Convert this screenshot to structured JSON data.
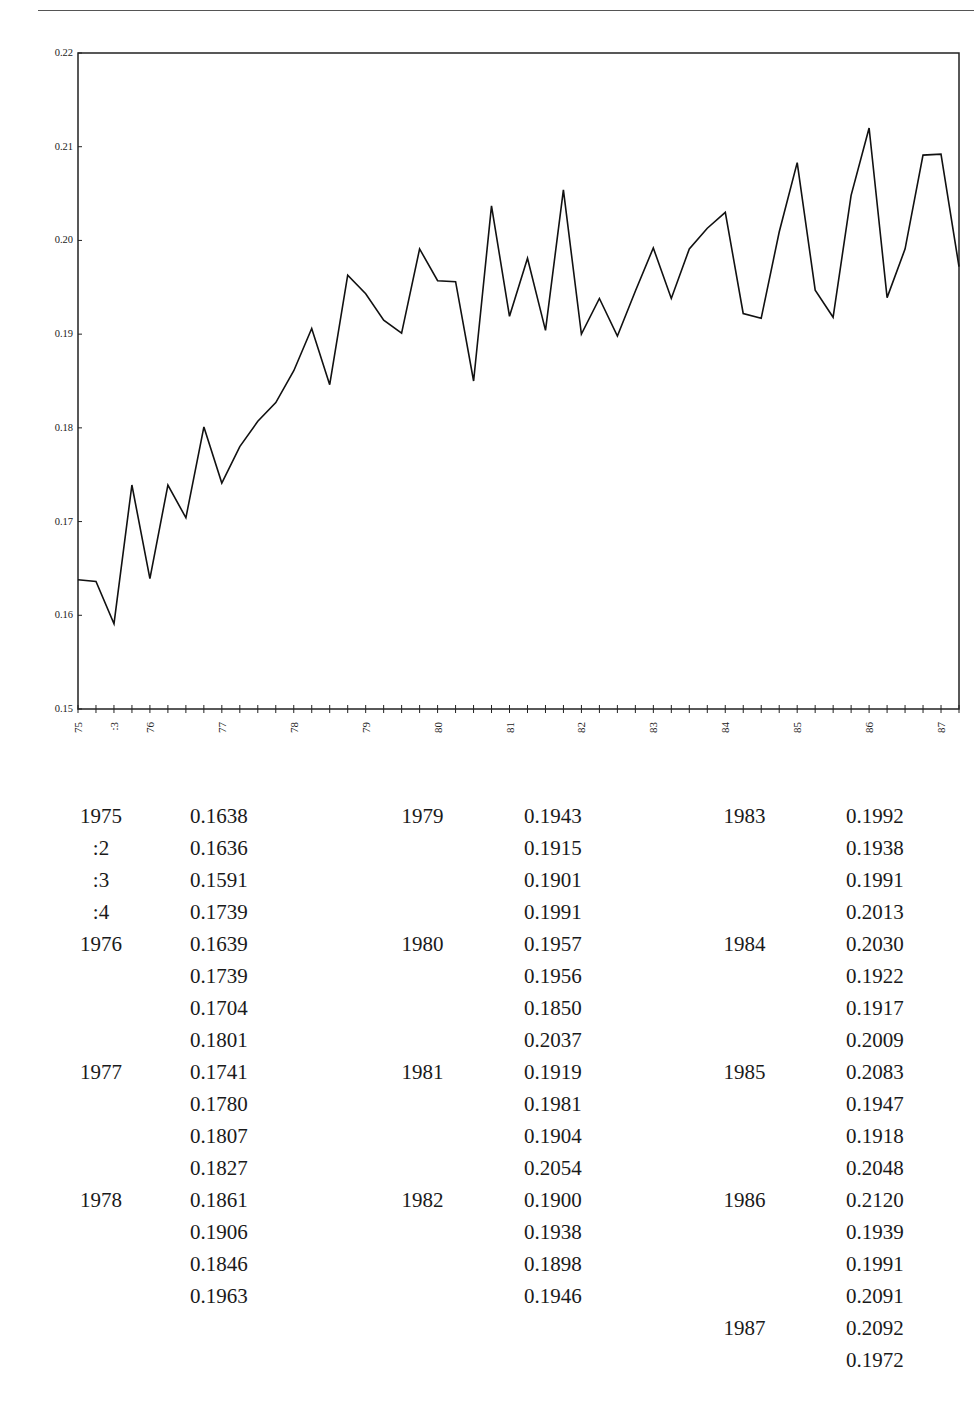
{
  "chart_data": {
    "type": "line",
    "title": "",
    "xlabel": "",
    "ylabel": "",
    "ylim": [
      0.15,
      0.22
    ],
    "yticks": [
      "0.15",
      "0.16",
      "0.17",
      "0.18",
      "0.19",
      "0.20",
      "0.21",
      "0.22"
    ],
    "xtick_labels": [
      {
        "index": 0,
        "label": "75"
      },
      {
        "index": 2,
        "label": ":3"
      },
      {
        "index": 4,
        "label": "76"
      },
      {
        "index": 8,
        "label": "77"
      },
      {
        "index": 12,
        "label": "78"
      },
      {
        "index": 16,
        "label": "79"
      },
      {
        "index": 20,
        "label": "80"
      },
      {
        "index": 24,
        "label": "81"
      },
      {
        "index": 28,
        "label": "82"
      },
      {
        "index": 32,
        "label": "83"
      },
      {
        "index": 36,
        "label": "84"
      },
      {
        "index": 40,
        "label": "85"
      },
      {
        "index": 44,
        "label": "86"
      },
      {
        "index": 48,
        "label": "87"
      }
    ],
    "grid": false,
    "legend": null,
    "series": [
      {
        "name": "quarterly series",
        "x": [
          "1975:1",
          "1975:2",
          "1975:3",
          "1975:4",
          "1976:1",
          "1976:2",
          "1976:3",
          "1976:4",
          "1977:1",
          "1977:2",
          "1977:3",
          "1977:4",
          "1978:1",
          "1978:2",
          "1978:3",
          "1978:4",
          "1979:1",
          "1979:2",
          "1979:3",
          "1979:4",
          "1980:1",
          "1980:2",
          "1980:3",
          "1980:4",
          "1981:1",
          "1981:2",
          "1981:3",
          "1981:4",
          "1982:1",
          "1982:2",
          "1982:3",
          "1982:4",
          "1983:1",
          "1983:2",
          "1983:3",
          "1983:4",
          "1984:1",
          "1984:2",
          "1984:3",
          "1984:4",
          "1985:1",
          "1985:2",
          "1985:3",
          "1985:4",
          "1986:1",
          "1986:2",
          "1986:3",
          "1986:4",
          "1987:1",
          "1987:2"
        ],
        "values": [
          0.1638,
          0.1636,
          0.1591,
          0.1739,
          0.1639,
          0.1739,
          0.1704,
          0.1801,
          0.1741,
          0.178,
          0.1807,
          0.1827,
          0.1861,
          0.1906,
          0.1846,
          0.1963,
          0.1943,
          0.1915,
          0.1901,
          0.1991,
          0.1957,
          0.1956,
          0.185,
          0.2037,
          0.1919,
          0.1981,
          0.1904,
          0.2054,
          0.19,
          0.1938,
          0.1898,
          0.1946,
          0.1992,
          0.1938,
          0.1991,
          0.2013,
          0.203,
          0.1922,
          0.1917,
          0.2009,
          0.2083,
          0.1947,
          0.1918,
          0.2048,
          0.212,
          0.1939,
          0.1991,
          0.2091,
          0.2092,
          0.1972
        ]
      }
    ]
  },
  "table": {
    "columns": [
      {
        "rows": [
          {
            "label": "1975",
            "value": "0.1638"
          },
          {
            "label": ":2",
            "value": "0.1636"
          },
          {
            "label": ":3",
            "value": "0.1591"
          },
          {
            "label": ":4",
            "value": "0.1739"
          },
          {
            "label": "1976",
            "value": "0.1639"
          },
          {
            "label": "",
            "value": "0.1739"
          },
          {
            "label": "",
            "value": "0.1704"
          },
          {
            "label": "",
            "value": "0.1801"
          },
          {
            "label": "1977",
            "value": "0.1741"
          },
          {
            "label": "",
            "value": "0.1780"
          },
          {
            "label": "",
            "value": "0.1807"
          },
          {
            "label": "",
            "value": "0.1827"
          },
          {
            "label": "1978",
            "value": "0.1861"
          },
          {
            "label": "",
            "value": "0.1906"
          },
          {
            "label": "",
            "value": "0.1846"
          },
          {
            "label": "",
            "value": "0.1963"
          }
        ]
      },
      {
        "rows": [
          {
            "label": "1979",
            "value": "0.1943"
          },
          {
            "label": "",
            "value": "0.1915"
          },
          {
            "label": "",
            "value": "0.1901"
          },
          {
            "label": "",
            "value": "0.1991"
          },
          {
            "label": "1980",
            "value": "0.1957"
          },
          {
            "label": "",
            "value": "0.1956"
          },
          {
            "label": "",
            "value": "0.1850"
          },
          {
            "label": "",
            "value": "0.2037"
          },
          {
            "label": "1981",
            "value": "0.1919"
          },
          {
            "label": "",
            "value": "0.1981"
          },
          {
            "label": "",
            "value": "0.1904"
          },
          {
            "label": "",
            "value": "0.2054"
          },
          {
            "label": "1982",
            "value": "0.1900"
          },
          {
            "label": "",
            "value": "0.1938"
          },
          {
            "label": "",
            "value": "0.1898"
          },
          {
            "label": "",
            "value": "0.1946"
          }
        ]
      },
      {
        "rows": [
          {
            "label": "1983",
            "value": "0.1992"
          },
          {
            "label": "",
            "value": "0.1938"
          },
          {
            "label": "",
            "value": "0.1991"
          },
          {
            "label": "",
            "value": "0.2013"
          },
          {
            "label": "1984",
            "value": "0.2030"
          },
          {
            "label": "",
            "value": "0.1922"
          },
          {
            "label": "",
            "value": "0.1917"
          },
          {
            "label": "",
            "value": "0.2009"
          },
          {
            "label": "1985",
            "value": "0.2083"
          },
          {
            "label": "",
            "value": "0.1947"
          },
          {
            "label": "",
            "value": "0.1918"
          },
          {
            "label": "",
            "value": "0.2048"
          },
          {
            "label": "1986",
            "value": "0.2120"
          },
          {
            "label": "",
            "value": "0.1939"
          },
          {
            "label": "",
            "value": "0.1991"
          },
          {
            "label": "",
            "value": "0.2091"
          },
          {
            "label": "1987",
            "value": "0.2092"
          },
          {
            "label": "",
            "value": "0.1972"
          }
        ]
      }
    ]
  }
}
